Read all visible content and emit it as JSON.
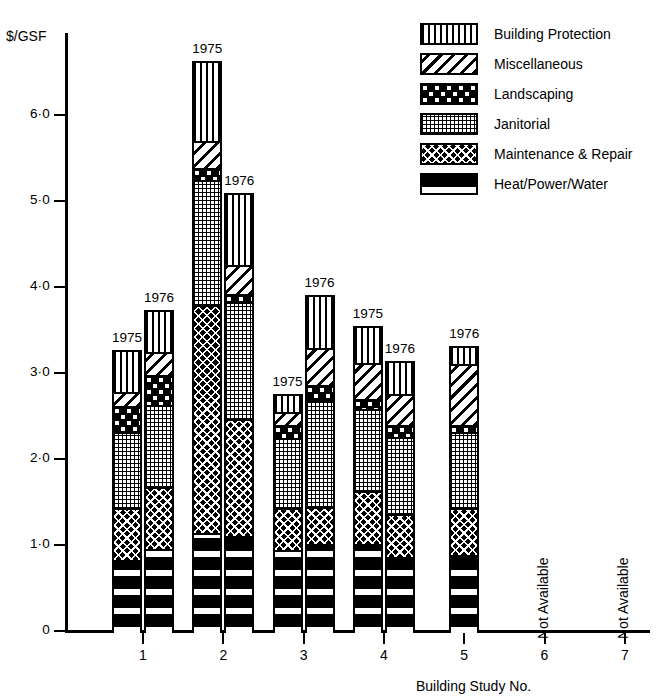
{
  "chart_data": {
    "type": "bar",
    "subtype": "stacked",
    "title": "",
    "ylabel": "$/GSF",
    "xlabel": "Building Study No.",
    "ylim": [
      0,
      7.0
    ],
    "yticks": [
      0,
      1.0,
      2.0,
      3.0,
      4.0,
      5.0,
      6.0
    ],
    "ytick_labels": [
      "0",
      "1·0",
      "2·0",
      "3·0",
      "4·0",
      "5·0",
      "6·0"
    ],
    "xticks": [
      1,
      2,
      3,
      4,
      5,
      6,
      7
    ],
    "xtick_labels": [
      "1",
      "2",
      "3",
      "4",
      "5",
      "6",
      "7"
    ],
    "grid": false,
    "legend_position": "top-right",
    "series": [
      {
        "name": "Building Protection",
        "key": "building",
        "pattern": "vertical-stripes"
      },
      {
        "name": "Miscellaneous",
        "key": "misc",
        "pattern": "diagonal-stripes"
      },
      {
        "name": "Landscaping",
        "key": "landscaping",
        "pattern": "dot-grid"
      },
      {
        "name": "Janitorial",
        "key": "janitorial",
        "pattern": "fine-crosshatch"
      },
      {
        "name": "Maintenance & Repair",
        "key": "maintenance",
        "pattern": "dense-crosshatch"
      },
      {
        "name": "Heat/Power/Water",
        "key": "heat",
        "pattern": "black-with-white-bands"
      }
    ],
    "bars": [
      {
        "study": 1,
        "year": "1975",
        "total": 3.27,
        "segments": {
          "heat": 0.83,
          "maintenance": 0.6,
          "janitorial": 0.88,
          "landscaping": 0.31,
          "misc": 0.16,
          "building": 0.49
        }
      },
      {
        "study": 1,
        "year": "1976",
        "total": 3.73,
        "segments": {
          "heat": 0.95,
          "maintenance": 0.72,
          "janitorial": 0.96,
          "landscaping": 0.35,
          "misc": 0.26,
          "building": 0.49
        }
      },
      {
        "study": 2,
        "year": "1975",
        "total": 6.63,
        "segments": {
          "heat": 1.14,
          "maintenance": 2.65,
          "janitorial": 1.45,
          "landscaping": 0.14,
          "misc": 0.32,
          "building": 0.93
        }
      },
      {
        "study": 2,
        "year": "1976",
        "total": 5.09,
        "segments": {
          "heat": 1.11,
          "maintenance": 1.36,
          "janitorial": 1.35,
          "landscaping": 0.1,
          "misc": 0.33,
          "building": 0.84
        }
      },
      {
        "study": 3,
        "year": "1975",
        "total": 2.76,
        "segments": {
          "heat": 0.94,
          "maintenance": 0.49,
          "janitorial": 0.81,
          "landscaping": 0.15,
          "misc": 0.16,
          "building": 0.21
        }
      },
      {
        "study": 3,
        "year": "1976",
        "total": 3.91,
        "segments": {
          "heat": 1.01,
          "maintenance": 0.43,
          "janitorial": 1.25,
          "landscaping": 0.17,
          "misc": 0.43,
          "building": 0.62
        }
      },
      {
        "study": 4,
        "year": "1975",
        "total": 3.55,
        "segments": {
          "heat": 1.01,
          "maintenance": 0.62,
          "janitorial": 0.95,
          "landscaping": 0.12,
          "misc": 0.42,
          "building": 0.43
        }
      },
      {
        "study": 4,
        "year": "1976",
        "total": 3.14,
        "segments": {
          "heat": 0.86,
          "maintenance": 0.5,
          "janitorial": 0.9,
          "landscaping": 0.14,
          "misc": 0.35,
          "building": 0.39
        }
      },
      {
        "study": 5,
        "year": "1976",
        "total": 3.31,
        "segments": {
          "heat": 0.88,
          "maintenance": 0.55,
          "janitorial": 0.88,
          "landscaping": 0.08,
          "misc": 0.72,
          "building": 0.2
        }
      }
    ],
    "not_available": [
      {
        "study": 6,
        "text": "Not Available"
      },
      {
        "study": 7,
        "text": "Not Available"
      }
    ]
  },
  "legend": {
    "items": [
      {
        "label": "Building Protection"
      },
      {
        "label": "Miscellaneous"
      },
      {
        "label": "Landscaping"
      },
      {
        "label": "Janitorial"
      },
      {
        "label": "Maintenance & Repair"
      },
      {
        "label": "Heat/Power/Water"
      }
    ]
  },
  "axis": {
    "y_title": "$/GSF",
    "x_title": "Building Study No."
  }
}
